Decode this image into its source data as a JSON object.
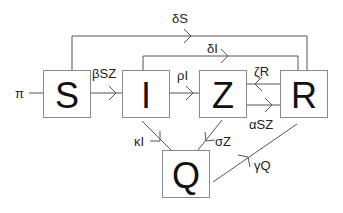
{
  "diagram": {
    "type": "compartment-flow",
    "nodes": {
      "S": {
        "label": "S"
      },
      "I": {
        "label": "I"
      },
      "Z": {
        "label": "Z"
      },
      "R": {
        "label": "R"
      },
      "Q": {
        "label": "Q"
      }
    },
    "edges": [
      {
        "id": "pi",
        "from": "",
        "to": "S",
        "label": "π"
      },
      {
        "id": "beta",
        "from": "S",
        "to": "I",
        "label": "βSZ"
      },
      {
        "id": "rho",
        "from": "I",
        "to": "Z",
        "label": "ρI"
      },
      {
        "id": "zeta",
        "from": "R",
        "to": "Z",
        "label": "ζR"
      },
      {
        "id": "alpha",
        "from": "Z",
        "to": "R",
        "label": "αSZ"
      },
      {
        "id": "deltaS",
        "from": "S",
        "to": "R",
        "label": "δS"
      },
      {
        "id": "deltaI",
        "from": "I",
        "to": "R",
        "label": "δI"
      },
      {
        "id": "kappa",
        "from": "I",
        "to": "Q",
        "label": "κI"
      },
      {
        "id": "sigma",
        "from": "Z",
        "to": "Q",
        "label": "σZ"
      },
      {
        "id": "gamma",
        "from": "Q",
        "to": "R",
        "label": "γQ"
      }
    ]
  }
}
